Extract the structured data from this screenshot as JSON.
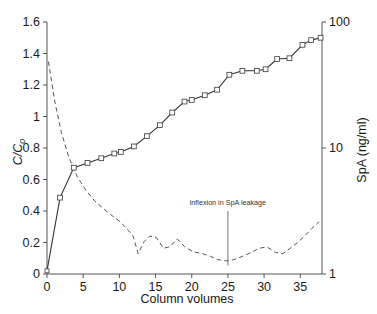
{
  "chart_data": {
    "type": "line",
    "title": "",
    "xlabel": "Column volumes",
    "ylabel": "C/C₀",
    "ylabel_right": "SpA (ng/ml)",
    "xlim": [
      0,
      38
    ],
    "ylim": [
      0,
      1.6
    ],
    "ylim_right": [
      1,
      100
    ],
    "right_axis_scale": "log",
    "grid": false,
    "legend_position": "none",
    "xticks": [
      0,
      5,
      10,
      15,
      20,
      25,
      30,
      35
    ],
    "xticklabels": [
      "0",
      "5",
      "10",
      "15",
      "20",
      "25",
      "30",
      "35"
    ],
    "yticks": [
      0,
      0.2,
      0.4,
      0.6,
      0.8,
      1,
      1.2,
      1.4,
      1.6
    ],
    "yticklabels": [
      "0",
      "0.2",
      "0.4",
      "0.6",
      "0.8",
      "1",
      "1.2",
      "1.4",
      "1.6"
    ],
    "yticks_right": [
      1,
      10,
      100
    ],
    "yticklabels_right": [
      "1",
      "10",
      "100"
    ],
    "series": [
      {
        "name": "breakthrough",
        "axis": "left",
        "style": "solid",
        "marker": "square-open",
        "x": [
          0,
          1.8,
          3.7,
          5.6,
          7.5,
          9.3,
          10.2,
          12.0,
          13.8,
          15.6,
          17.3,
          19.0,
          20.0,
          21.8,
          23.5,
          25.2,
          27.0,
          29.0,
          30.2,
          31.8,
          33.5,
          35.3,
          36.5,
          37.8
        ],
        "y": [
          0.02,
          0.485,
          0.675,
          0.705,
          0.735,
          0.765,
          0.775,
          0.81,
          0.875,
          0.945,
          1.025,
          1.095,
          1.105,
          1.135,
          1.17,
          1.265,
          1.29,
          1.29,
          1.3,
          1.365,
          1.37,
          1.455,
          1.485,
          1.5
        ]
      },
      {
        "name": "SpA leakage",
        "axis": "right",
        "style": "dashed",
        "marker": "none",
        "x": [
          0.2,
          1.1,
          2.0,
          3.0,
          4.2,
          5.4,
          6.6,
          7.8,
          9.0,
          10.1,
          11.0,
          11.9,
          12.6,
          13.4,
          14.2,
          15.1,
          16.1,
          17.0,
          18.0,
          19.0,
          20.2,
          21.5,
          22.6,
          23.6,
          24.7,
          25.8,
          27.0,
          28.2,
          29.3,
          30.4,
          31.6,
          32.6,
          33.6,
          34.6,
          35.6,
          36.6,
          37.6
        ],
        "y_left_equiv": [
          1.06,
          0.8,
          0.62,
          0.5,
          0.41,
          0.345,
          0.3,
          0.265,
          0.235,
          0.205,
          0.175,
          0.135,
          0.065,
          0.105,
          0.135,
          0.13,
          0.085,
          0.095,
          0.125,
          0.095,
          0.075,
          0.065,
          0.055,
          0.045,
          0.04,
          0.045,
          0.055,
          0.07,
          0.085,
          0.09,
          0.07,
          0.065,
          0.085,
          0.11,
          0.135,
          0.165,
          0.195
        ],
        "y_ngml": [
          48.5,
          23.0,
          13.2,
          8.5,
          5.9,
          4.6,
          3.8,
          3.3,
          2.9,
          2.6,
          2.3,
          2.0,
          1.45,
          1.8,
          2.0,
          1.95,
          1.6,
          1.65,
          1.9,
          1.65,
          1.5,
          1.45,
          1.38,
          1.3,
          1.27,
          1.3,
          1.38,
          1.48,
          1.6,
          1.64,
          1.48,
          1.45,
          1.6,
          1.77,
          2.0,
          2.3,
          2.6
        ]
      }
    ],
    "annotations": [
      {
        "text": "inflexion  in  SpA  leakage",
        "x": 25,
        "text_y_left": 0.44,
        "leader_from_y_left": 0.4,
        "leader_to_y_left": 0.055
      }
    ]
  },
  "axes": {
    "left_title": "C/C",
    "left_title_sub": "o",
    "right_title": "SpA (ng/ml)",
    "x_title": "Column volumes"
  },
  "colors": {
    "axis": "#555555",
    "solid_series": "#333333",
    "dashed_series": "#555555",
    "marker_fill": "#ffffff",
    "marker_stroke": "#444444",
    "text": "#1a1a1a",
    "annotation": "#333333",
    "background": "#ffffff"
  }
}
